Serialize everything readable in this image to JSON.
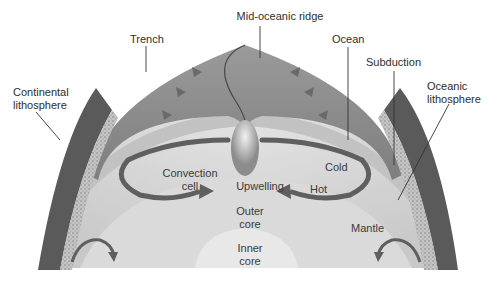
{
  "diagram": {
    "colors": {
      "background": "#ffffff",
      "ocean_plate": "#8a8a8a",
      "lithosphere_band": "#b9b9b9",
      "mantle": "#d4d4d4",
      "outer_core": "#dcdcdc",
      "inner_core": "#e6e6e6",
      "convection_arrow": "#5f5f5f",
      "label_text": "#2e2e2e",
      "leader_line": "#333333"
    },
    "labels": {
      "mid_oceanic_ridge": "Mid-oceanic ridge",
      "trench": "Trench",
      "ocean": "Ocean",
      "subduction": "Subduction",
      "continental_lithosphere": "Continental\nlithosphere",
      "oceanic_lithosphere": "Oceanic\nlithosphere",
      "convection_cell": "Convection\ncell",
      "upwelling": "Upwelling",
      "cold": "Cold",
      "hot": "Hot",
      "outer_core": "Outer\ncore",
      "inner_core": "Inner\ncore",
      "mantle": "Mantle"
    }
  }
}
